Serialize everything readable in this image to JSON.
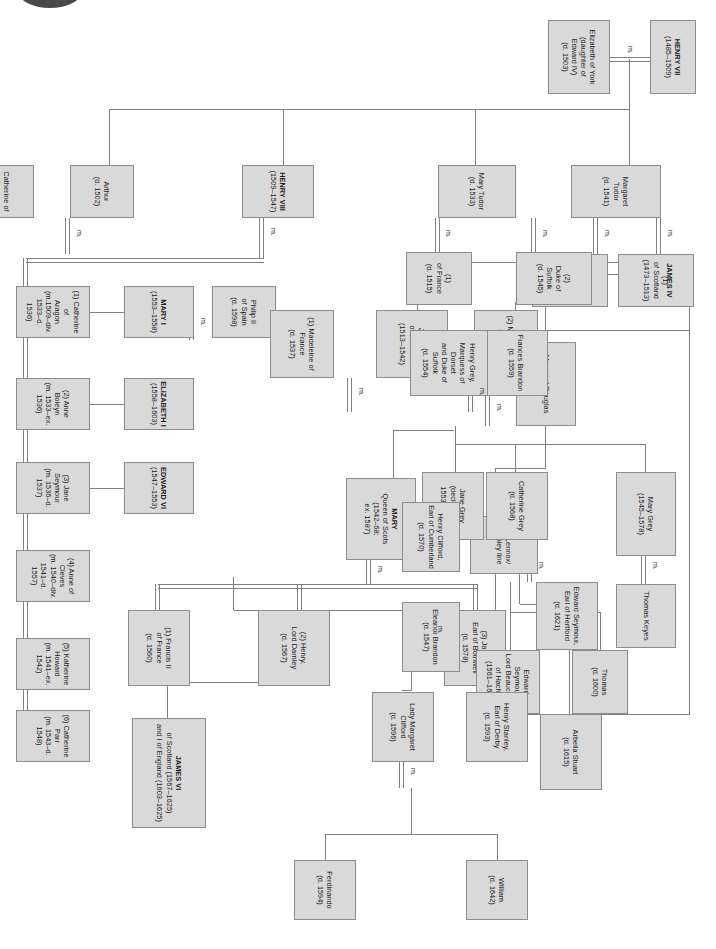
{
  "document": {
    "title": "Tudor and Stuart Royal Family Tree",
    "orientation": "rotated-90-clockwise",
    "marriage_symbol": "m.",
    "colors": {
      "node_fill": "#d9d9d9",
      "node_border": "#8c8c8c",
      "connector": "#808080",
      "text": "#1a1a1a",
      "background": "#ffffff"
    }
  },
  "nodes": {
    "henry_vii": {
      "name": "HENRY VII",
      "dates": "(1485–1509)"
    },
    "elizabeth_of_york": {
      "name": "Elizabeth of York",
      "dates": "(daughter of\nEdward IV)\n(d. 1503)"
    },
    "arthur": {
      "name": "Arthur",
      "dates": "(d. 1502)"
    },
    "catherine_of_aragon_1": {
      "name": "Catherine of\nAragon",
      "dates": ""
    },
    "henry_viii": {
      "name": "HENRY VIII",
      "dates": "(1509–1547)"
    },
    "margaret_tudor": {
      "name": "Margaret Tudor",
      "dates": "(d. 1541)"
    },
    "james_iv": {
      "name": "JAMES IV",
      "dates": "(1)\nof Scotland\n(1473–1513)"
    },
    "archibald_douglas": {
      "name": "Archibald Douglas,",
      "dates": "(2)\n6th Earl of Angus\n(d. 1557)"
    },
    "mary_tudor": {
      "name": "Mary Tudor",
      "dates": "(d. 1533)"
    },
    "louis_xii": {
      "name": "Louis XII",
      "dates": "(1)\nof France\n(d. 1515)"
    },
    "charles_brandon": {
      "name": "Charles Brandon,",
      "dates": "(2)\nDuke of Suffolk\n(d. 1545)"
    },
    "wife1": {
      "name": "(1) Catherine of\nAragon\n(m.1509–div.\n1533–d. 1536)"
    },
    "wife2": {
      "name": "(2) Anne Boleyn\n(m. 1533–ex. 1536)"
    },
    "wife3": {
      "name": "(3) Jane Seymour\n(m. 1536–d. 1537)"
    },
    "wife4": {
      "name": "(4) Anne of Cleves\n(m. 1540–div.\n1541–d. 1557)"
    },
    "wife5": {
      "name": "(5) Katherine\nHoward\n(m. 1541–ex. 1542)"
    },
    "wife6": {
      "name": "(6) Catherine Parr\n(m. 1543–d. 1548)"
    },
    "mary_i": {
      "name": "MARY I",
      "dates": "(1553–1558)"
    },
    "philip_ii": {
      "name": "Philip II",
      "dates": "of Spain\n(d. 1598)"
    },
    "elizabeth_i": {
      "name": "ELIZABETH I",
      "dates": "(1558–1603)"
    },
    "edward_vi": {
      "name": "EDWARD VI",
      "dates": "(1547–1553)"
    },
    "james_v": {
      "name": "JAMES V",
      "dates": "of Scotland\n(1513–1542)"
    },
    "madeleine": {
      "name": "(1) Madeleine of\nFrance\n(d. 1537)"
    },
    "mary_of_guise": {
      "name": "(2) Mary of Guise\n(d. 1560)"
    },
    "margaret_douglas": {
      "name": "Margaret Douglas"
    },
    "lennox_line": {
      "name": "the Lennox/\nDarnley line"
    },
    "mary_qos": {
      "name": "MARY",
      "dates": "Queen of Scots\n(1542–68;\nex. 1587)"
    },
    "francis_ii": {
      "name": "(1) Francis II\nof France\n(d. 1560)"
    },
    "darnley": {
      "name": "(2) Henry,\nLord Darnley\n(d. 1567)"
    },
    "bothwell": {
      "name": "(3) James,\nEarl of Bothwell\n(d. 1578)"
    },
    "arbella_stuart": {
      "name": "Arbella Stuart\n(d. 1615)"
    },
    "james_vi": {
      "name": "JAMES VI",
      "dates": "of Scotland (1567–1625)\nand I of England (1603–1625)"
    },
    "frances_brandon": {
      "name": "Frances Brandon\n(d. 1559)"
    },
    "henry_grey": {
      "name": "Henry Grey,\nMarquess of Dorset\nand Duke of Suffolk\n(d. 1554)"
    },
    "jane_grey": {
      "name": "Jane Grey\n(decl. queen\n1553–1554)"
    },
    "catherine_grey": {
      "name": "Catherine Grey\n(d. 1568)"
    },
    "edward_seymour_hertford": {
      "name": "Edward Seymour,\nEarl of Hertford\n(d. 1621)"
    },
    "thomas_seymour": {
      "name": "Thomas\n(d. 1600)"
    },
    "edward_beauchamp": {
      "name": "Edward Seymour,\nLord Beauchamp\nof Hache\n(1561–1612)"
    },
    "mary_grey": {
      "name": "Mary Grey\n(1545–1578)"
    },
    "thomas_keyes": {
      "name": "Thomas Keyes"
    },
    "eleanor_brandon": {
      "name": "Eleanor Brandon\n(d. 1547)"
    },
    "henry_clifford": {
      "name": "Henry Clifford,\nEarl of Cumberland\n(d. 1570)"
    },
    "margaret_clifford": {
      "name": "Lady Margaret\nClifford\n(d. 1596)"
    },
    "henry_stanley": {
      "name": "Henry Stanley,\nEarl of Derby\n(d. 1593)"
    },
    "ferdinando": {
      "name": "Ferdinando\n(d. 1594)"
    },
    "william": {
      "name": "William\n(d. 1642)"
    }
  }
}
